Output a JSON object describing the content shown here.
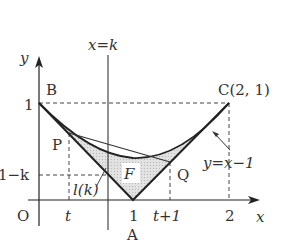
{
  "diagram": {
    "labels": {
      "y_axis": "y",
      "x_axis": "x",
      "line_xk": "x=k",
      "point_B": "B",
      "point_C": "C(2, 1)",
      "point_P": "P",
      "point_Q": "Q",
      "point_A": "A",
      "origin": "O",
      "y_tick_1": "1",
      "y_tick_1mk": "1−k",
      "x_tick_t": "t",
      "x_tick_1": "1",
      "x_tick_t1": "t+1",
      "x_tick_2": "2",
      "region_F": "F",
      "segment_lk": "l(k)",
      "curve_label": "y=x−1"
    },
    "colors": {
      "stroke": "#222222",
      "fill_region": "#d6d6d6",
      "dashed": "#444444"
    }
  }
}
